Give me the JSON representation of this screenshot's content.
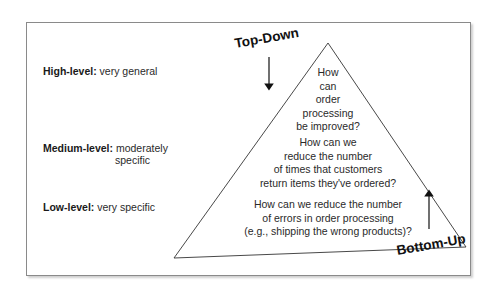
{
  "diagram": {
    "type": "pyramid",
    "levels": [
      {
        "label": "High-level:",
        "description": "very general",
        "description_line2": ""
      },
      {
        "label": "Medium-level:",
        "description": "moderately",
        "description_line2": "specific"
      },
      {
        "label": "Low-level:",
        "description": "very specific",
        "description_line2": ""
      }
    ],
    "questions": [
      {
        "lines": [
          "How",
          "can",
          "order",
          "processing",
          "be improved?"
        ]
      },
      {
        "lines": [
          "How can we",
          "reduce the number",
          "of times that customers",
          "return items they've ordered?"
        ]
      },
      {
        "lines": [
          "How can we reduce the number",
          "of errors in order processing",
          "(e.g., shipping the wrong products)?"
        ]
      }
    ],
    "approaches": {
      "top_down": "Top-Down",
      "bottom_up": "Bottom-Up"
    }
  }
}
